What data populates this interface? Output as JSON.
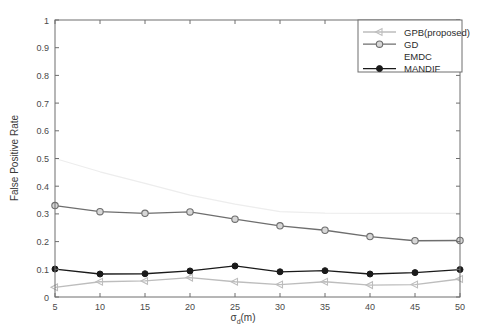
{
  "chart_data": {
    "type": "line",
    "title": "",
    "xlabel": "σ_d(m)",
    "xlabel_base": "σ",
    "xlabel_sub": "d",
    "xlabel_unit": "(m)",
    "ylabel": "False Positive Rate",
    "x": [
      5,
      10,
      15,
      20,
      25,
      30,
      35,
      40,
      45,
      50
    ],
    "xlim": [
      5,
      50
    ],
    "ylim": [
      0,
      1
    ],
    "xticks": [
      "5",
      "10",
      "15",
      "20",
      "25",
      "30",
      "35",
      "40",
      "45",
      "50"
    ],
    "yticks": [
      "0",
      "0.1",
      "0.2",
      "0.3",
      "0.4",
      "0.5",
      "0.6",
      "0.7",
      "0.8",
      "0.9",
      "1"
    ],
    "grid": false,
    "legend_position": "top-right",
    "series": [
      {
        "name": "GPB(proposed)",
        "marker": "left-triangle",
        "color": "#bdbdbd",
        "values": [
          0.035,
          0.055,
          0.058,
          0.07,
          0.055,
          0.045,
          0.055,
          0.043,
          0.045,
          0.065
        ]
      },
      {
        "name": "GD",
        "marker": "circle-open",
        "color": "#6e6e6e",
        "values": [
          0.33,
          0.308,
          0.302,
          0.307,
          0.281,
          0.257,
          0.241,
          0.218,
          0.203,
          0.204
        ]
      },
      {
        "name": "EMDC",
        "marker": "none",
        "color": "#ededed",
        "values": [
          0.5,
          0.452,
          0.41,
          0.368,
          0.335,
          0.308,
          0.303,
          0.302,
          0.303,
          0.302
        ]
      },
      {
        "name": "MANDIF",
        "marker": "circle-filled",
        "color": "#1a1a1a",
        "values": [
          0.101,
          0.083,
          0.084,
          0.094,
          0.112,
          0.091,
          0.095,
          0.083,
          0.088,
          0.099
        ]
      }
    ]
  },
  "legend": {
    "entries": [
      {
        "label": "GPB(proposed)"
      },
      {
        "label": "GD"
      },
      {
        "label": "EMDC"
      },
      {
        "label": "MANDIF"
      }
    ]
  },
  "colors": {
    "frame": "#6e6e6e",
    "background": "#ffffff",
    "gpb": "#bdbdbd",
    "gd": "#6e6e6e",
    "emdc": "#ededed",
    "mandif": "#1a1a1a"
  }
}
